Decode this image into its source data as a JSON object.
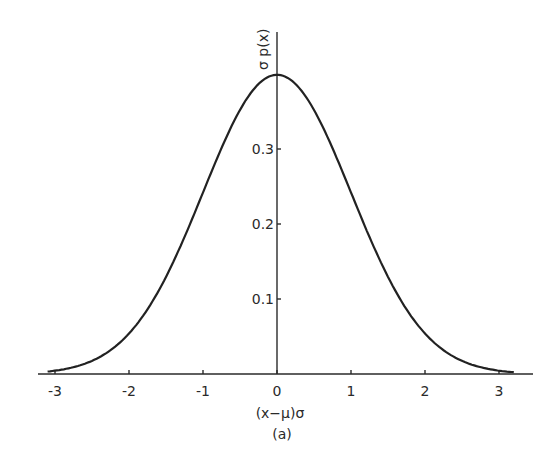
{
  "chart_data": {
    "type": "line",
    "title": "",
    "subtitle": "",
    "caption": "(a)",
    "xlabel": "(x−μ)σ",
    "ylabel": "σ p(x)",
    "xlim": [
      -3.3,
      3.45
    ],
    "ylim": [
      0,
      0.47
    ],
    "grid": false,
    "legend": null,
    "x_ticks": [
      -3,
      -2,
      -1,
      0,
      1,
      2,
      3
    ],
    "x_tick_labels": [
      "-3",
      "-2",
      "-1",
      "0",
      "1",
      "2",
      "3"
    ],
    "y_ticks": [
      0.1,
      0.2,
      0.3
    ],
    "y_tick_labels": [
      "0.1",
      "0.2",
      "0.3"
    ],
    "series": [
      {
        "name": "standard normal density",
        "x": [
          -3.1,
          -3.0,
          -2.5,
          -2.0,
          -1.5,
          -1.0,
          -0.5,
          0.0,
          0.5,
          1.0,
          1.5,
          2.0,
          2.5,
          3.0,
          3.2
        ],
        "values": [
          0.003,
          0.004,
          0.018,
          0.054,
          0.13,
          0.242,
          0.352,
          0.399,
          0.352,
          0.242,
          0.13,
          0.054,
          0.018,
          0.004,
          0.002
        ]
      }
    ]
  }
}
